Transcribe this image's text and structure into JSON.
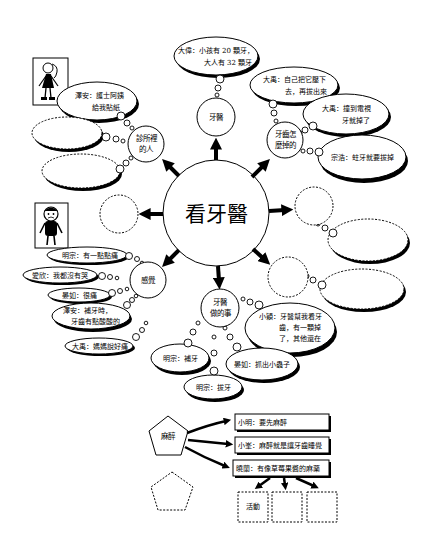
{
  "central_topic": "看牙醫",
  "nodes": {
    "dentist": {
      "label": "牙醫",
      "bubbles": [
        {
          "lines": [
            "大偉：小孩有 20 顆牙，",
            "大人有 32 顆牙"
          ]
        }
      ]
    },
    "how_teeth_fall": {
      "label_lines": [
        "牙齒怎",
        "麼掉的"
      ],
      "bubbles": [
        {
          "lines": [
            "大禹：自己把它壓下",
            "去，再拔出來"
          ]
        },
        {
          "lines": [
            "大禹：撞到電視",
            "牙就掉了"
          ]
        },
        {
          "lines": [
            "宗浩：蛀牙就要拔掉"
          ]
        }
      ]
    },
    "clinic_people": {
      "label_lines": [
        "診所裡",
        "的人"
      ],
      "bubbles": [
        {
          "lines": [
            "澤安：護士阿姨",
            "給我貼紙"
          ]
        },
        {
          "lines": []
        },
        {
          "lines": []
        }
      ]
    },
    "feelings": {
      "label": "感覺",
      "bubbles": [
        {
          "lines": [
            "明宗：有一點點痛"
          ]
        },
        {
          "lines": [
            "愛欣：我都沒有哭"
          ]
        },
        {
          "lines": [
            "晏如：很痛"
          ]
        },
        {
          "lines": [
            "澤安：補牙時，",
            "牙齒有點酸酸的"
          ]
        },
        {
          "lines": [
            "大禹：媽媽說好痛"
          ]
        }
      ]
    },
    "dentist_work": {
      "label_lines": [
        "牙醫",
        "做的事"
      ],
      "bubbles": [
        {
          "lines": [
            "小穎：牙醫幫我看牙",
            "齒，有一顆掉",
            "了，其他還在"
          ]
        },
        {
          "lines": [
            "明宗：補牙"
          ]
        },
        {
          "lines": [
            "晏如：抓出小蟲子"
          ]
        },
        {
          "lines": [
            "明宗：拔牙"
          ]
        }
      ]
    }
  },
  "anesthesia": {
    "label": "麻醉",
    "statements": [
      "小明：要先麻醉",
      "小峯：麻醉就是讓牙齒睡覺",
      "曉蘭：有像草莓果醬的麻藥"
    ],
    "activity_boxes": [
      "活動",
      "",
      ""
    ]
  },
  "icons": {
    "figure_top": "girl-figure-icon",
    "figure_bottom": "boy-figure-icon"
  }
}
